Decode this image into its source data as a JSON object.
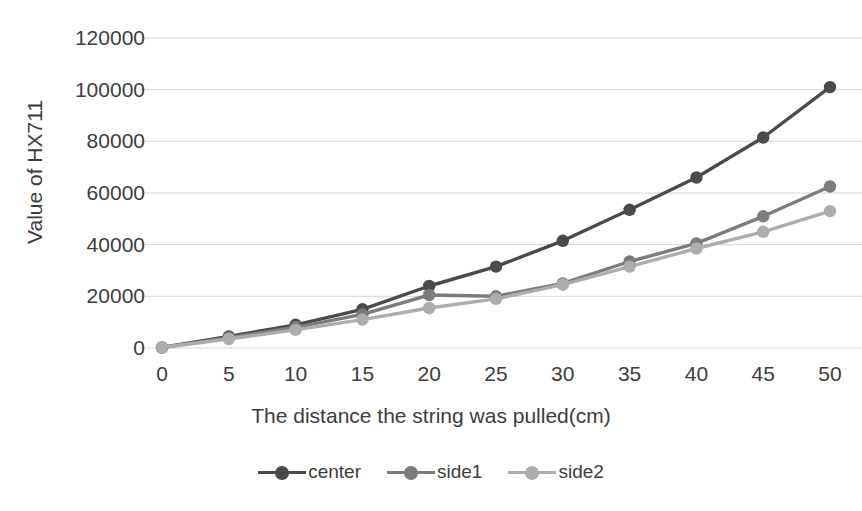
{
  "chart_data": {
    "type": "line",
    "title": "",
    "xlabel": "The distance the string was pulled(cm)",
    "ylabel": "Value of HX711",
    "categories": [
      0,
      5,
      10,
      15,
      20,
      25,
      30,
      35,
      40,
      45,
      50
    ],
    "xticklabels": [
      "0",
      "5",
      "10",
      "15",
      "20",
      "25",
      "30",
      "35",
      "40",
      "45",
      "50"
    ],
    "yticklabels": [
      "0",
      "20000",
      "40000",
      "60000",
      "80000",
      "100000",
      "120000"
    ],
    "yticks": [
      0,
      20000,
      40000,
      60000,
      80000,
      100000,
      120000
    ],
    "ylim": [
      0,
      120000
    ],
    "grid": "horizontal",
    "legend_position": "bottom",
    "series": [
      {
        "name": "center",
        "color": "#4a4a4a",
        "values": [
          200,
          4500,
          9000,
          15000,
          24000,
          31500,
          41500,
          53500,
          66000,
          81500,
          101000
        ]
      },
      {
        "name": "side1",
        "color": "#7c7c7c",
        "values": [
          200,
          4000,
          8000,
          13000,
          20500,
          20000,
          25000,
          33500,
          40500,
          51000,
          62500
        ]
      },
      {
        "name": "side2",
        "color": "#adadad",
        "values": [
          200,
          3500,
          7000,
          11000,
          15500,
          19000,
          24500,
          31500,
          38500,
          45000,
          53000
        ]
      }
    ]
  },
  "legend": {
    "items": [
      {
        "label": "center"
      },
      {
        "label": "side1"
      },
      {
        "label": "side2"
      }
    ]
  }
}
